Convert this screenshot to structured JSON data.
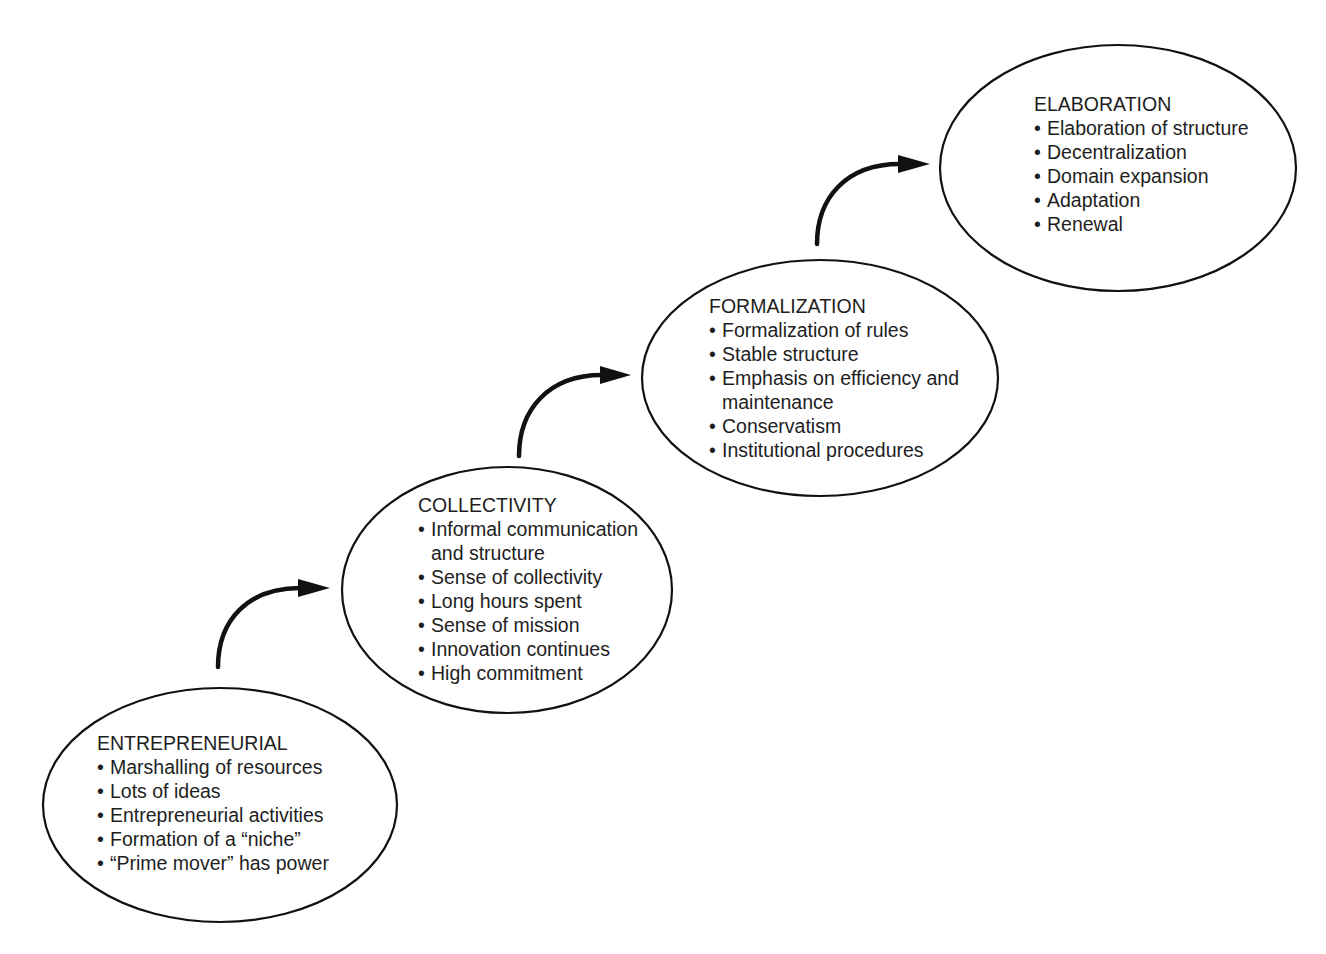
{
  "diagram": {
    "type": "organizational-life-cycle",
    "stages": [
      {
        "id": "entrepreneurial",
        "title": "ENTREPRENEURIAL",
        "items": [
          "Marshalling of resources",
          "Lots of ideas",
          "Entrepreneurial activities",
          "Formation of a “niche”",
          "“Prime mover” has power"
        ]
      },
      {
        "id": "collectivity",
        "title": "COLLECTIVITY",
        "items": [
          "Informal communication\nand structure",
          "Sense of collectivity",
          "Long hours spent",
          "Sense of mission",
          "Innovation continues",
          "High commitment"
        ]
      },
      {
        "id": "formalization",
        "title": "FORMALIZATION",
        "items": [
          "Formalization of rules",
          "Stable structure",
          "Emphasis on efficiency and\nmaintenance",
          "Conservatism",
          "Institutional procedures"
        ]
      },
      {
        "id": "elaboration",
        "title": "ELABORATION",
        "items": [
          "Elaboration of structure",
          "Decentralization",
          "Domain expansion",
          "Adaptation",
          "Renewal"
        ]
      }
    ],
    "arrows": [
      {
        "from": "entrepreneurial",
        "to": "collectivity"
      },
      {
        "from": "collectivity",
        "to": "formalization"
      },
      {
        "from": "formalization",
        "to": "elaboration"
      }
    ],
    "colors": {
      "stroke": "#111111",
      "text": "#1e1e1e",
      "background": "#ffffff"
    }
  }
}
